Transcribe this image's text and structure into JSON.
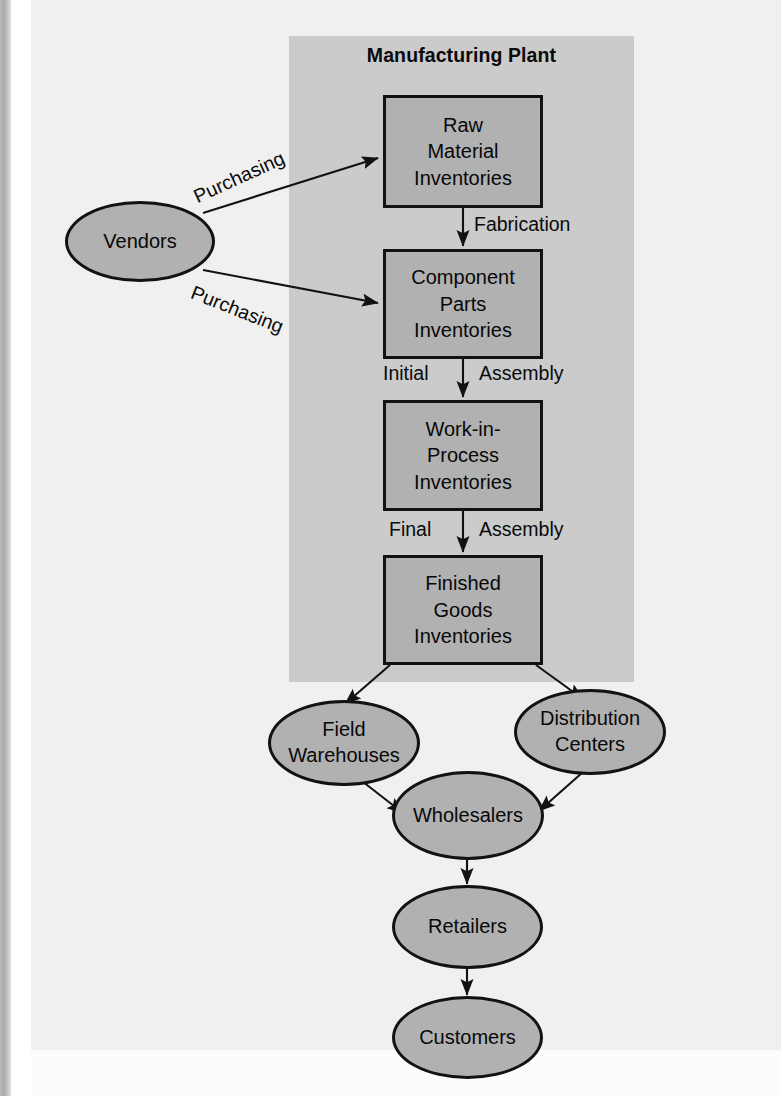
{
  "diagram": {
    "title": "Manufacturing Plant",
    "colors": {
      "page_background": "#f0f0f0",
      "plant_panel": "#cbcbcb",
      "node_fill": "#b1b1b1",
      "node_stroke": "#121212",
      "text": "#080808"
    },
    "plant_boxes": [
      {
        "id": "raw-material-inventories",
        "lines": [
          "Raw",
          "Material",
          "Inventories"
        ],
        "text": "Raw Material Inventories"
      },
      {
        "id": "component-parts-inventories",
        "lines": [
          "Component",
          "Parts",
          "Inventories"
        ],
        "text": "Component Parts Inventories"
      },
      {
        "id": "work-in-process-inventories",
        "lines": [
          "Work-in-",
          "Process",
          "Inventories"
        ],
        "text": "Work-in-Process Inventories"
      },
      {
        "id": "finished-goods-inventories",
        "lines": [
          "Finished",
          "Goods",
          "Inventories"
        ],
        "text": "Finished Goods Inventories"
      }
    ],
    "ellipses": [
      {
        "id": "vendors",
        "lines": [
          "Vendors"
        ],
        "text": "Vendors"
      },
      {
        "id": "field-warehouses",
        "lines": [
          "Field",
          "Warehouses"
        ],
        "text": "Field Warehouses"
      },
      {
        "id": "distribution-centers",
        "lines": [
          "Distribution",
          "Centers"
        ],
        "text": "Distribution Centers"
      },
      {
        "id": "wholesalers",
        "lines": [
          "Wholesalers"
        ],
        "text": "Wholesalers"
      },
      {
        "id": "retailers",
        "lines": [
          "Retailers"
        ],
        "text": "Retailers"
      },
      {
        "id": "customers",
        "lines": [
          "Customers"
        ],
        "text": "Customers"
      }
    ],
    "edge_labels": [
      {
        "id": "purchasing-upper",
        "text": "Purchasing"
      },
      {
        "id": "purchasing-lower",
        "text": "Purchasing"
      },
      {
        "id": "fabrication",
        "text": "Fabrication"
      },
      {
        "id": "initial",
        "text": "Initial"
      },
      {
        "id": "assembly-initial",
        "text": "Assembly"
      },
      {
        "id": "final",
        "text": "Final"
      },
      {
        "id": "assembly-final",
        "text": "Assembly"
      }
    ],
    "flows": [
      {
        "from": "Vendors",
        "to": "Raw Material Inventories",
        "label": "Purchasing"
      },
      {
        "from": "Vendors",
        "to": "Component Parts Inventories",
        "label": "Purchasing"
      },
      {
        "from": "Raw Material Inventories",
        "to": "Component Parts Inventories",
        "label": "Fabrication"
      },
      {
        "from": "Component Parts Inventories",
        "to": "Work-in-Process Inventories",
        "label": "Initial Assembly"
      },
      {
        "from": "Work-in-Process Inventories",
        "to": "Finished Goods Inventories",
        "label": "Final Assembly"
      },
      {
        "from": "Finished Goods Inventories",
        "to": "Field Warehouses",
        "label": ""
      },
      {
        "from": "Finished Goods Inventories",
        "to": "Distribution Centers",
        "label": ""
      },
      {
        "from": "Field Warehouses",
        "to": "Wholesalers",
        "label": ""
      },
      {
        "from": "Distribution Centers",
        "to": "Wholesalers",
        "label": ""
      },
      {
        "from": "Wholesalers",
        "to": "Retailers",
        "label": ""
      },
      {
        "from": "Retailers",
        "to": "Customers",
        "label": ""
      }
    ]
  }
}
